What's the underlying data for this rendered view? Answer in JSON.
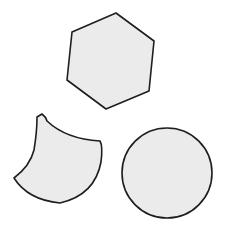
{
  "canvas": {
    "width": 227,
    "height": 238,
    "background": "#ffffff"
  },
  "style": {
    "fill": "#ebebeb",
    "stroke": "#1e1e1e",
    "stroke_width": 1.6
  },
  "shapes": [
    {
      "name": "hexagon",
      "type": "polygon",
      "points": "116,13 154,41 149,91 106,109 67,80 72,32"
    },
    {
      "name": "curved-crescent-shape",
      "type": "path",
      "d": "M37,117 L42,114 Q46,117 47,121 Q66,139 100,141 Q103,146 101,162 Q95,195 60,203 Q28,200 14,178 Q30,166 34,150 Q37,132 37,117 Z"
    },
    {
      "name": "circle",
      "type": "circle",
      "cx": 167,
      "cy": 173,
      "r": 45
    }
  ]
}
